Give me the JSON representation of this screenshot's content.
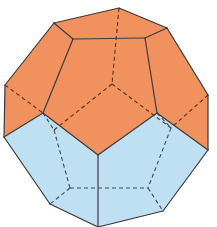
{
  "diagram": {
    "colors": {
      "top_half": "#F0915E",
      "bottom_half": "#BFE0F2",
      "edge": "#3b3a3a",
      "background": "#ffffff"
    },
    "faces": {
      "top": [
        {
          "id": "top-front-pentagon",
          "points": "73,39 145,38 157,113 98,155 43,113"
        },
        {
          "id": "top-cap",
          "points": "54,23 119,8 167,28 145,38 73,39"
        },
        {
          "id": "top-left",
          "points": "54,23 73,39 43,113 4,137 5,85"
        },
        {
          "id": "top-right",
          "points": "167,28 208,95 208,150 157,113 145,38"
        }
      ],
      "bottom": [
        {
          "id": "bottom-left",
          "points": "4,137 43,113 98,155 98,227 50,204"
        },
        {
          "id": "bottom-right",
          "points": "98,155 157,113 208,150 163,211 98,227"
        }
      ]
    },
    "visible_edges": [
      "119,8 167,28",
      "167,28 208,95",
      "208,95 208,150",
      "208,150 163,211",
      "163,211 98,227",
      "98,227 50,204",
      "50,204 4,137",
      "4,137 5,85",
      "5,85 54,23",
      "54,23 119,8",
      "54,23 73,39",
      "73,39 145,38",
      "145,38 167,28",
      "73,39 43,113",
      "145,38 157,113",
      "4,137 43,113",
      "43,113 98,155",
      "98,155 157,113",
      "157,113 208,150",
      "98,155 98,227"
    ],
    "hidden_edges_upper": [
      "119,8 112,84",
      "112,84 54,130",
      "112,84 171,128",
      "5,85 43,113",
      "208,95 171,128"
    ],
    "hidden_edges_lower": [
      "54,130 70,188",
      "171,128 148,188",
      "70,188 148,188",
      "70,188 50,204",
      "148,188 163,211",
      "43,113 54,130",
      "157,113 171,128"
    ]
  }
}
